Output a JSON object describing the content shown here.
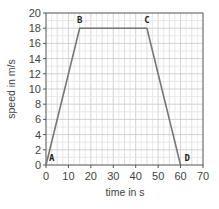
{
  "chart_data": {
    "type": "line",
    "title": "",
    "xlabel": "time in s",
    "ylabel": "speed in m/s",
    "xlim": [
      0,
      70
    ],
    "ylim": [
      0,
      20
    ],
    "x_ticks": [
      0,
      10,
      20,
      30,
      40,
      50,
      60,
      70
    ],
    "y_ticks": [
      0,
      2,
      4,
      6,
      8,
      10,
      12,
      14,
      16,
      18,
      20
    ],
    "grid": true,
    "legend": null,
    "series": [
      {
        "name": "speed",
        "color": "#777777",
        "x": [
          0,
          15,
          45,
          60
        ],
        "y": [
          0,
          18,
          18,
          0
        ]
      }
    ],
    "annotations": [
      {
        "label": "A",
        "x": 0,
        "y": 0
      },
      {
        "label": "B",
        "x": 15,
        "y": 18
      },
      {
        "label": "C",
        "x": 45,
        "y": 18
      },
      {
        "label": "D",
        "x": 60,
        "y": 0
      }
    ]
  }
}
